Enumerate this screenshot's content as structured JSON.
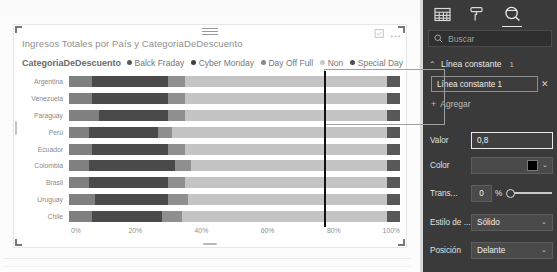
{
  "visual": {
    "title": "Ingresos Totales por País y CategoriaDeDescuento",
    "grip_icon": "drag-handle-icon",
    "focus_icon": "focus-mode-icon",
    "more_label": "...",
    "scroll_nub_icon": "scrollbar-nub"
  },
  "legend": {
    "title": "CategoriaDeDescuento",
    "items": [
      {
        "label": "Balck Fraday",
        "color": "#595959"
      },
      {
        "label": "Cyber Monday",
        "color": "#3f3f3f"
      },
      {
        "label": "Day Off Full",
        "color": "#8a8a8a"
      },
      {
        "label": "Non",
        "color": "#c9c9c9"
      },
      {
        "label": "Special Day",
        "color": "#4f4f4f"
      }
    ]
  },
  "chart_data": {
    "type": "bar",
    "subtype": "100% stacked horizontal bar",
    "title": "Ingresos Totales por País y CategoriaDeDescuento",
    "xlabel": "",
    "ylabel": "",
    "xlim": [
      0,
      100
    ],
    "xticks": [
      "0%",
      "20%",
      "40%",
      "60%",
      "80%",
      "100%"
    ],
    "xtick_values": [
      0,
      20,
      40,
      60,
      80,
      100
    ],
    "grid": false,
    "legend_position": "top",
    "categories": [
      "Argentina",
      "Venezuela",
      "Paraguay",
      "Perú",
      "Ecuador",
      "Colombia",
      "Brasil",
      "Uruguay",
      "Chile"
    ],
    "series": [
      {
        "name": "Balck Fraday",
        "color": "#808080",
        "values": [
          7,
          7,
          9,
          6,
          7,
          6,
          6,
          8,
          7
        ]
      },
      {
        "name": "Cyber Monday",
        "color": "#4a4a4a",
        "values": [
          23,
          23,
          21,
          21,
          23,
          26,
          24,
          22,
          21
        ]
      },
      {
        "name": "Day Off Full",
        "color": "#8f8f8f",
        "values": [
          5,
          5,
          5,
          4,
          5,
          5,
          5,
          6,
          6
        ]
      },
      {
        "name": "Non",
        "color": "#c4c4c4",
        "values": [
          61,
          61,
          61,
          65,
          61,
          59,
          61,
          60,
          62
        ]
      },
      {
        "name": "Special Day",
        "color": "#585858",
        "values": [
          4,
          4,
          4,
          4,
          4,
          4,
          4,
          4,
          4
        ]
      }
    ],
    "constant_line": {
      "label": "Línea constante 1",
      "value_pct": 80,
      "color": "#111111",
      "style": "Sólido",
      "position": "Delante"
    }
  },
  "pane": {
    "tabs": [
      {
        "name": "fields-icon",
        "label": "Campos",
        "active": false
      },
      {
        "name": "format-paint-roller-icon",
        "label": "Formato",
        "active": false
      },
      {
        "name": "analytics-magnifier-icon",
        "label": "Análisis",
        "active": true
      }
    ],
    "search": {
      "placeholder": "Buscar",
      "value": "",
      "icon": "search-icon"
    },
    "section": {
      "title": "Línea constante",
      "count": "1",
      "expanded": true,
      "chevron": "⌃"
    },
    "item": {
      "label": "Línea constante 1",
      "remove_label": "✕"
    },
    "add": {
      "plus": "+",
      "label": "Agregar"
    },
    "properties": [
      {
        "key": "valor",
        "label": "Valor",
        "value": "0,8",
        "type": "text",
        "focused": true
      },
      {
        "key": "color",
        "label": "Color",
        "value": "#000000",
        "type": "color",
        "caret": "⌄"
      },
      {
        "key": "trans",
        "label": "Trans...",
        "value": "0",
        "unit": "%",
        "type": "slider",
        "slider_pct": 0
      },
      {
        "key": "estilo",
        "label": "Estilo de ...",
        "value": "Sólido",
        "type": "select",
        "caret": "⌄"
      },
      {
        "key": "posicion",
        "label": "Posición",
        "value": "Delante",
        "type": "select",
        "caret": "⌄"
      }
    ]
  },
  "colors": {
    "pane_bg": "#3a3a3a",
    "canvas_bg": "#fcfcfc",
    "accent_line": "#111111"
  }
}
